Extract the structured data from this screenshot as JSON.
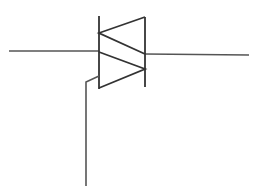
{
  "diagram": {
    "type": "schematic-symbol",
    "component": "triac",
    "label": "TRIAC symbol",
    "terminals": [
      {
        "name": "MT1",
        "side": "left"
      },
      {
        "name": "MT2",
        "side": "right"
      },
      {
        "name": "Gate",
        "side": "bottom"
      }
    ],
    "colors": {
      "background": "#ffffff",
      "line": "#333333",
      "wire": "#555555"
    }
  }
}
